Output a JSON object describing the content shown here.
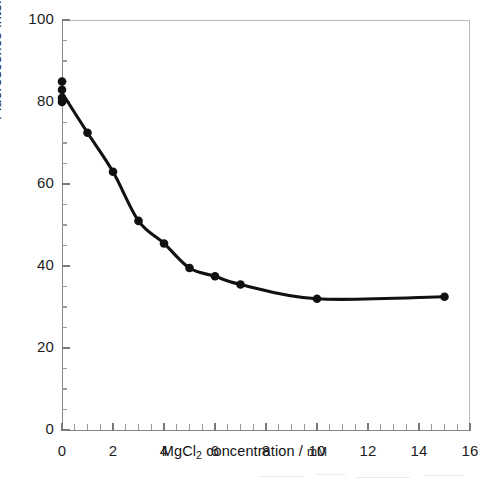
{
  "figure": {
    "background_color": "#ffffff",
    "ink_color": "#111111",
    "axis_color": "#888888"
  },
  "chart_data": {
    "type": "line",
    "title": "",
    "subtitle": "",
    "xlabel_parts": {
      "prefix": "MgCl",
      "subscript": "2",
      "suffix": " concentration / ",
      "unit": "mM"
    },
    "xlabel": "MgCl2 concentration / mM",
    "ylabel": "Fluorescence intensity",
    "xlim": [
      0,
      16
    ],
    "ylim": [
      0,
      100
    ],
    "xticks": [
      0,
      2,
      4,
      6,
      8,
      10,
      12,
      14,
      16
    ],
    "xtick_labels": [
      "0",
      "2",
      "4",
      "6",
      "8",
      "10",
      "12",
      "14",
      "16"
    ],
    "xminor_step": 0.5,
    "yticks": [
      0,
      20,
      40,
      60,
      80,
      100
    ],
    "ytick_labels": [
      "0",
      "20",
      "40",
      "60",
      "80",
      "100"
    ],
    "yminor_step": 5,
    "grid": false,
    "legend": null,
    "marker": "filled-circle",
    "series": [
      {
        "name": "Fluorescence intensity",
        "x": [
          0,
          0,
          0,
          0,
          1,
          2,
          3,
          4,
          5,
          6,
          7,
          10,
          15
        ],
        "values": [
          85,
          83,
          81,
          80,
          72.5,
          63,
          51,
          45.5,
          39.5,
          37.5,
          35.5,
          32,
          32.5
        ]
      }
    ]
  }
}
